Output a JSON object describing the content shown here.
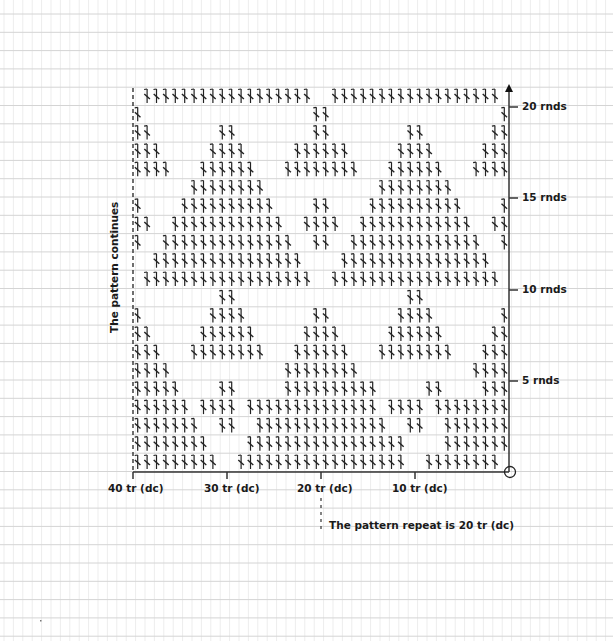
{
  "chart": {
    "columns": 40,
    "rows": 21,
    "repeat_width": 20,
    "stitch_symbol": "tr-dc-crochet",
    "colors": {
      "ink": "#222222",
      "grid_h": "#d4d4d4",
      "grid_v": "#ededed"
    },
    "row_patterns": [
      "111111111001111111111111111110011111111",
      "1111111100001111111111111111100001111111",
      "1111111001100111111111111110011001111111",
      "1111110111101111111111111101111011111111",
      "1111100001100000111111111100000110000111",
      "1111000000000000111111110000000000001111",
      "1110001111111100011111100011111111000111",
      "1100000111111000001111000001111110000011",
      "1000000011110000000110000000111100000001",
      "0000000001100000000000000000011000000000",
      "0111111111111111111001111111111111111110",
      "0011111111111111110000111111111111111100",
      "1001111111111111100110011111111111111001",
      "1100111111111111001111001111111111110011",
      "1000011111111110000110000111111111100001",
      "0000001111111100000000000011111111000000",
      "1111000111111000111111110001111110001111",
      "1110000011110000011111100000111100000111",
      "1100000001100000000110000000011000000011",
      "1000000000000000000110000000000000000001",
      "0111111111111111111001111111111111111110"
    ]
  },
  "axes": {
    "x_ticks": [
      "40 tr (dc)",
      "30 tr (dc)",
      "20 tr (dc)",
      "10 tr (dc)"
    ],
    "y_ticks": [
      "20 rnds",
      "15 rnds",
      "10 rnds",
      "5 rnds"
    ]
  },
  "annotations": {
    "left_note": "The pattern continues",
    "repeat_note": "The pattern repeat is 20 tr (dc)"
  }
}
